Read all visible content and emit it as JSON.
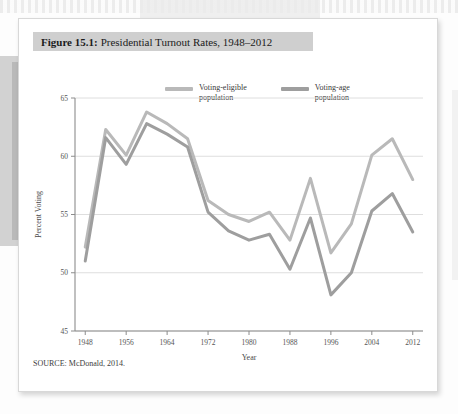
{
  "figure": {
    "number_label": "Figure 15.1:",
    "title_rest": "Presidential Turnout Rates, 1948–2012",
    "source": "SOURCE: McDonald, 2014."
  },
  "legend": {
    "items": [
      {
        "label_line1": "Voting-eligible",
        "label_line2": "population",
        "color": "#b9b9b9"
      },
      {
        "label_line1": "Voting-age",
        "label_line2": "population",
        "color": "#9e9e9e"
      }
    ]
  },
  "chart_data": {
    "type": "line",
    "title": "Figure 15.1: Presidential Turnout Rates, 1948–2012",
    "xlabel": "Year",
    "ylabel": "Percent Voting",
    "x": [
      1948,
      1952,
      1956,
      1960,
      1964,
      1968,
      1972,
      1976,
      1980,
      1984,
      1988,
      1992,
      1996,
      2000,
      2004,
      2008,
      2012
    ],
    "xticks": [
      1948,
      1956,
      1964,
      1972,
      1980,
      1988,
      1996,
      2004,
      2012
    ],
    "yticks": [
      45,
      50,
      55,
      60,
      65
    ],
    "xlim": [
      1946,
      2014
    ],
    "ylim": [
      45,
      65
    ],
    "grid": true,
    "legend_position": "top",
    "series": [
      {
        "name": "Voting-eligible population",
        "color": "#b9b9b9",
        "values": [
          52.2,
          62.3,
          60.1,
          63.8,
          62.8,
          61.5,
          56.2,
          55.0,
          54.4,
          55.2,
          52.8,
          58.1,
          51.7,
          54.2,
          60.1,
          61.5,
          58.0
        ]
      },
      {
        "name": "Voting-age population",
        "color": "#9e9e9e",
        "values": [
          51.0,
          61.6,
          59.3,
          62.8,
          61.9,
          60.8,
          55.2,
          53.6,
          52.8,
          53.3,
          50.3,
          54.7,
          48.1,
          50.0,
          55.3,
          56.8,
          53.5
        ]
      }
    ]
  }
}
